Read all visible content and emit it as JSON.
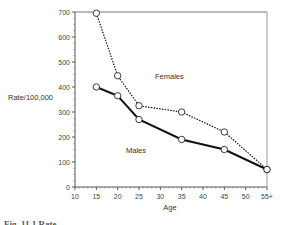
{
  "chart_data": {
    "type": "line",
    "title": "",
    "xlabel": "Age",
    "ylabel": "Rate/100,000",
    "x_ticks": [
      "10",
      "15",
      "20",
      "25",
      "30",
      "35",
      "40",
      "45",
      "50",
      "55+"
    ],
    "y_ticks": [
      "0",
      "100",
      "200",
      "300",
      "400",
      "500",
      "600",
      "700"
    ],
    "xlim": [
      10,
      55
    ],
    "ylim": [
      0,
      700
    ],
    "grid": false,
    "legend": "inline labels",
    "x": [
      15,
      20,
      25,
      35,
      45,
      55
    ],
    "series": [
      {
        "name": "Females",
        "style": "dotted",
        "values": [
          695,
          445,
          325,
          300,
          220,
          70
        ]
      },
      {
        "name": "Males",
        "style": "solid",
        "values": [
          400,
          365,
          270,
          190,
          150,
          70
        ]
      }
    ]
  },
  "labels": {
    "females": "Females",
    "males": "Males",
    "y_axis": "Rate/100,000",
    "x_axis": "Age",
    "caption": "Fig. 11.1 Rate..."
  }
}
